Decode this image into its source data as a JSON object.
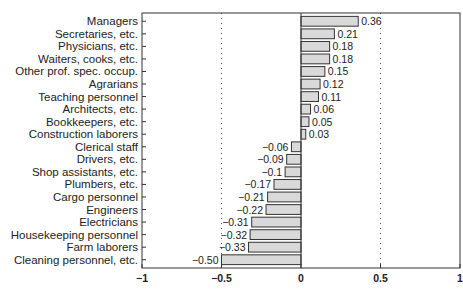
{
  "chart_data": {
    "type": "bar",
    "orientation": "horizontal",
    "title": "",
    "xlabel": "",
    "ylabel": "",
    "xlim": [
      -1,
      1
    ],
    "xticks": [
      "−1",
      "−0.5",
      "0",
      "0.5",
      "1"
    ],
    "grid": "dotted vertical lines at -0.5 and 0.5",
    "legend": null,
    "categories": [
      "Managers",
      "Secretaries, etc.",
      "Physicians, etc.",
      "Waiters, cooks, etc.",
      "Other prof. spec. occup.",
      "Agrarians",
      "Teaching personnel",
      "Architects, etc.",
      "Bookkeepers, etc.",
      "Construction laborers",
      "Clerical staff",
      "Drivers, etc.",
      "Shop assistants, etc.",
      "Plumbers, etc.",
      "Cargo personnel",
      "Engineers",
      "Electricians",
      "Housekeeping personnel",
      "Farm laborers",
      "Cleaning personnel, etc."
    ],
    "values": [
      0.36,
      0.21,
      0.18,
      0.18,
      0.15,
      0.12,
      0.11,
      0.06,
      0.05,
      0.03,
      -0.06,
      -0.09,
      -0.1,
      -0.17,
      -0.21,
      -0.22,
      -0.31,
      -0.32,
      -0.33,
      -0.5
    ],
    "value_labels": [
      "0.36",
      "0.21",
      "0.18",
      "0.18",
      "0.15",
      "0.12",
      "0.11",
      "0.06",
      "0.05",
      "0.03",
      "−0.06",
      "−0.09",
      "−0.1",
      "−0.17",
      "−0.21",
      "−0.22",
      "−0.31",
      "−0.32",
      "−0.33",
      "−0.50"
    ],
    "colors": {
      "bar_fill": "#d9d9d9",
      "bar_edge": "#333333",
      "axis": "#333333"
    }
  }
}
